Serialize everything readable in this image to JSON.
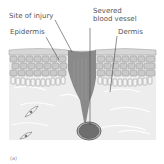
{
  "labels": {
    "site_of_injury": "Site of injury",
    "epidermis": "Epidermis",
    "severed_line1": "Severed",
    "severed_line2": "blood vessel",
    "dermis": "Dermis",
    "figure_label": "(a)"
  },
  "colors": {
    "background": "#ffffff",
    "dermis_fill": "#eeeeee",
    "epidermis_cell": "#c9c9c9",
    "cell_outline": "#8c8c8c",
    "surface": "#d8d8d8",
    "wound": "#8a8a8a",
    "vessel": "#6e6e6e",
    "vessel_ring": "#4a4a4a",
    "text": "#555555"
  }
}
